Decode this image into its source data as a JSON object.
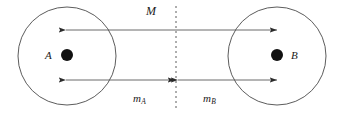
{
  "figure": {
    "type": "physics-diagram",
    "background_color": "#ffffff",
    "stroke_color": "#3a3a3a",
    "label_color": "#1a1a1a",
    "dot_color": "#111111"
  },
  "bodies": [
    {
      "id": "body-a",
      "label": "A",
      "center_x": 67,
      "center_y": 56,
      "radius": 49,
      "dot_x": 67,
      "dot_y": 55,
      "dot_radius": 6,
      "label_x": 45,
      "label_y": 50
    },
    {
      "id": "body-b",
      "label": "B",
      "center_x": 277,
      "center_y": 56,
      "radius": 49,
      "dot_x": 277,
      "dot_y": 55,
      "dot_radius": 6,
      "label_x": 291,
      "label_y": 50
    }
  ],
  "center_line": {
    "name": "dashed-center-line",
    "x": 176,
    "y_top": 6,
    "y_bottom": 111,
    "dash_pattern": "2 3"
  },
  "measurements": [
    {
      "id": "measure-m",
      "label": "M",
      "label_has_subscript": false,
      "subscript": "",
      "x_start": 66,
      "x_end": 277,
      "y": 30,
      "arrow_left": true,
      "arrow_right": true,
      "label_x": 146,
      "label_y": 5
    },
    {
      "id": "measure-ma",
      "label": "m",
      "label_has_subscript": true,
      "subscript": "A",
      "x_start": 66,
      "x_end": 175,
      "y": 80,
      "arrow_left": true,
      "arrow_right": true,
      "label_x": 133,
      "label_y": 93
    },
    {
      "id": "measure-mb",
      "label": "m",
      "label_has_subscript": true,
      "subscript": "B",
      "x_start": 178,
      "x_end": 277,
      "y": 80,
      "arrow_left": true,
      "arrow_right": true,
      "label_x": 203,
      "label_y": 93
    }
  ]
}
